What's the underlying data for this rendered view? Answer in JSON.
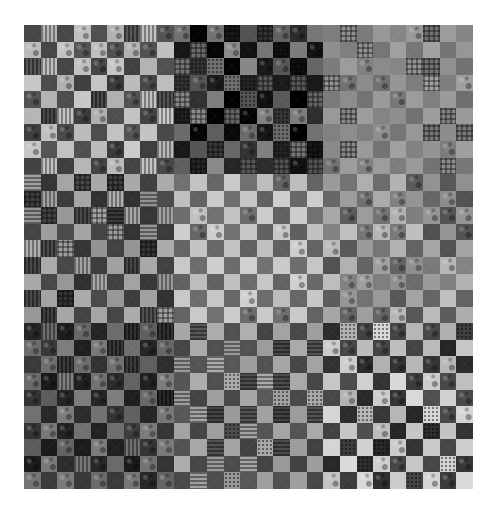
{
  "image": {
    "subject": "grayscale photograph of a patchwork checkerboard quilt",
    "background": "#ffffff",
    "quilt": {
      "x": 24,
      "y": 25,
      "width": 449,
      "height": 464,
      "columns": 27,
      "rows": 28,
      "blocks": [
        {
          "name": "top-left",
          "col0": 0,
          "col1": 9,
          "row0": 0,
          "row1": 9,
          "light": "#bdbdbd",
          "dark": "#474747",
          "textures": [
            "tex-stripe",
            "tex-print",
            "",
            "tex-print"
          ],
          "jitter": 14
        },
        {
          "name": "top-center",
          "col0": 9,
          "col1": 18,
          "row0": 0,
          "row1": 9,
          "light": "#6e6e6e",
          "dark": "#1c1c1c",
          "textures": [
            "tex-plaid",
            "tex-print",
            "tex-dots",
            "tex-print"
          ],
          "jitter": 30
        },
        {
          "name": "top-right",
          "col0": 18,
          "col1": 27,
          "row0": 0,
          "row1": 9,
          "light": "#959595",
          "dark": "#7a7a7a",
          "textures": [
            "",
            "tex-plaid",
            "tex-print",
            ""
          ],
          "jitter": 12
        },
        {
          "name": "middle-left",
          "col0": 0,
          "col1": 9,
          "row0": 9,
          "row1": 18,
          "light": "#9e9e9e",
          "dark": "#3e3e3e",
          "textures": [
            "tex-stripe",
            "tex-hstripe",
            "tex-plaid",
            ""
          ],
          "jitter": 14
        },
        {
          "name": "middle-center",
          "col0": 9,
          "col1": 18,
          "row0": 9,
          "row1": 18,
          "light": "#c6c6c6",
          "dark": "#686868",
          "textures": [
            "",
            "",
            "tex-print",
            ""
          ],
          "jitter": 10
        },
        {
          "name": "middle-right",
          "col0": 18,
          "col1": 27,
          "row0": 9,
          "row1": 18,
          "light": "#a6a6a6",
          "dark": "#6a6a6a",
          "textures": [
            "tex-print",
            "",
            "tex-print",
            ""
          ],
          "jitter": 26
        },
        {
          "name": "bottom-left",
          "col0": 0,
          "col1": 9,
          "row0": 18,
          "row1": 28,
          "light": "#6c6c6c",
          "dark": "#2a2a2a",
          "textures": [
            "tex-print",
            "tex-print",
            "tex-stripe",
            "tex-print"
          ],
          "jitter": 18
        },
        {
          "name": "bottom-center",
          "col0": 9,
          "col1": 18,
          "row0": 18,
          "row1": 28,
          "light": "#a2a2a2",
          "dark": "#4c4c4c",
          "textures": [
            "tex-hstripe",
            "",
            "tex-dots",
            ""
          ],
          "jitter": 12
        },
        {
          "name": "bottom-right",
          "col0": 18,
          "col1": 27,
          "row0": 18,
          "row1": 28,
          "light": "#c4c4c4",
          "dark": "#3a3a3a",
          "textures": [
            "tex-dots",
            "tex-print",
            "",
            "tex-print"
          ],
          "jitter": 22
        }
      ]
    }
  }
}
